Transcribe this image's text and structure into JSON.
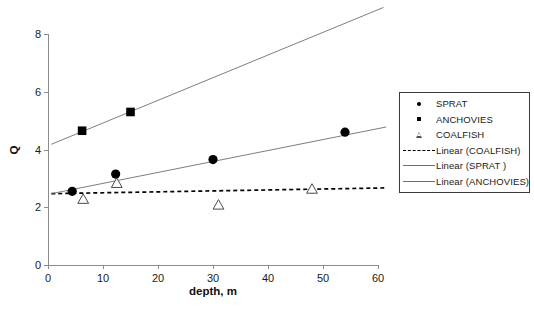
{
  "chart_data": {
    "type": "scatter",
    "title": "",
    "xlabel": "depth, m",
    "ylabel": "Q",
    "xlim": [
      0,
      60
    ],
    "ylim": [
      0,
      8
    ],
    "xticks": [
      0,
      10,
      20,
      30,
      40,
      50,
      60
    ],
    "yticks": [
      0,
      2,
      4,
      6,
      8
    ],
    "grid": false,
    "legend_position": "right",
    "series": [
      {
        "name": "SPRAT",
        "marker": "filled-circle",
        "points": [
          {
            "x": 4.4,
            "y": 2.55
          },
          {
            "x": 12.3,
            "y": 3.15
          },
          {
            "x": 30.0,
            "y": 3.65
          },
          {
            "x": 54.0,
            "y": 4.6
          }
        ]
      },
      {
        "name": "ANCHOVIES",
        "marker": "filled-square",
        "points": [
          {
            "x": 6.2,
            "y": 4.65
          },
          {
            "x": 15.0,
            "y": 5.3
          }
        ]
      },
      {
        "name": "COALFISH",
        "marker": "open-triangle",
        "points": [
          {
            "x": 6.4,
            "y": 2.3
          },
          {
            "x": 12.5,
            "y": 2.85
          },
          {
            "x": 31.0,
            "y": 2.1
          },
          {
            "x": 48.0,
            "y": 2.65
          }
        ]
      }
    ],
    "trendlines": [
      {
        "name": "Linear (COALFISH)",
        "style": "dashed",
        "x0": 0.6,
        "y0": 2.47,
        "x1": 61.5,
        "y1": 2.67
      },
      {
        "name": "Linear (SPRAT )",
        "style": "solid",
        "x0": 0.6,
        "y0": 2.47,
        "x1": 61.5,
        "y1": 4.78
      },
      {
        "name": "Linear (ANCHOVIES)",
        "style": "solid",
        "x0": 0.6,
        "y0": 4.18,
        "x1": 61.0,
        "y1": 8.92
      }
    ]
  },
  "axes": {
    "x_title": "depth, m",
    "y_title": "Q",
    "x_tick_labels": [
      "0",
      "10",
      "20",
      "30",
      "40",
      "50",
      "60"
    ],
    "y_tick_labels": [
      "0",
      "2",
      "4",
      "6",
      "8"
    ]
  },
  "legend": {
    "entries": [
      {
        "label": "SPRAT",
        "key": "filled-circle-marker"
      },
      {
        "label": "ANCHOVIES",
        "key": "filled-square-marker"
      },
      {
        "label": "COALFISH",
        "key": "open-triangle-marker"
      },
      {
        "label": "Linear (COALFISH)",
        "key": "dashed-line-swatch"
      },
      {
        "label": "Linear (SPRAT )",
        "key": "solid-line-swatch"
      },
      {
        "label": "Linear (ANCHOVIES)",
        "key": "solid-line-swatch"
      }
    ]
  },
  "colors": {
    "marker": "#000000",
    "axis": "#8c8c8c",
    "trendline": "#6e6e6e",
    "text": "#1a1a1a",
    "background": "#ffffff"
  }
}
